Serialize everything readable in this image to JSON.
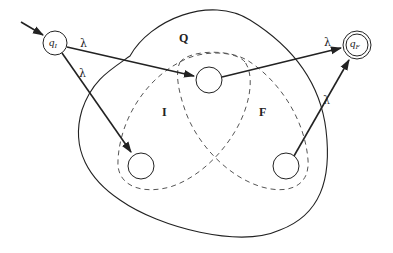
{
  "diagram": {
    "type": "automaton-construction",
    "sets": {
      "outer": {
        "label": "Q"
      },
      "initial": {
        "label": "I"
      },
      "final": {
        "label": "F"
      }
    },
    "states": {
      "q_initial": {
        "label": "q",
        "subscript": "I",
        "initial": true,
        "final": false
      },
      "q_final": {
        "label": "q",
        "subscript": "F",
        "initial": false,
        "final": true
      },
      "middle": {
        "label": "",
        "member_of": [
          "I",
          "F"
        ]
      },
      "left": {
        "label": "",
        "member_of": [
          "I"
        ]
      },
      "right": {
        "label": "",
        "member_of": [
          "F"
        ]
      }
    },
    "transitions": [
      {
        "from": "q_I",
        "to": "middle",
        "label": "λ"
      },
      {
        "from": "q_I",
        "to": "left",
        "label": "λ"
      },
      {
        "from": "middle",
        "to": "q_F",
        "label": "λ"
      },
      {
        "from": "right",
        "to": "q_F",
        "label": "λ"
      }
    ],
    "colors": {
      "stroke": "#222222",
      "dashed": "#555555",
      "background": "#ffffff"
    }
  }
}
